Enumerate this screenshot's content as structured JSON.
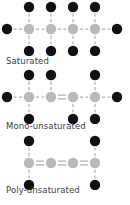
{
  "figure": {
    "background_color": "#ffffff",
    "carbon_color": "#b9b9b9",
    "hydrogen_color": "#111111",
    "bond_color": "#b0b0b0",
    "label_color": "#3d3d3d"
  },
  "legend_keys": {
    "carbon_atom": "carbon-atom-node",
    "hydrogen_atom": "hydrogen-atom-node",
    "single_bond": "single-bond-line",
    "double_bond": "double-bond-line"
  },
  "groups": [
    {
      "id": "saturated",
      "label": "Saturated",
      "carbon_count": 4,
      "carbons": [
        {
          "index": 1,
          "top_hydrogen": true,
          "bottom_hydrogen": true,
          "left_hydrogen": true,
          "right_hydrogen": false
        },
        {
          "index": 2,
          "top_hydrogen": true,
          "bottom_hydrogen": true,
          "left_hydrogen": false,
          "right_hydrogen": false
        },
        {
          "index": 3,
          "top_hydrogen": true,
          "bottom_hydrogen": true,
          "left_hydrogen": false,
          "right_hydrogen": false
        },
        {
          "index": 4,
          "top_hydrogen": true,
          "bottom_hydrogen": true,
          "left_hydrogen": false,
          "right_hydrogen": true
        }
      ],
      "backbone_bonds": [
        {
          "from": 1,
          "to": 2,
          "order": "single"
        },
        {
          "from": 2,
          "to": 3,
          "order": "single"
        },
        {
          "from": 3,
          "to": 4,
          "order": "single"
        }
      ],
      "double_bond_count": 0
    },
    {
      "id": "mono-unsaturated",
      "label": "Mono-unsaturated",
      "carbon_count": 4,
      "carbons": [
        {
          "index": 1,
          "top_hydrogen": true,
          "bottom_hydrogen": true,
          "left_hydrogen": true,
          "right_hydrogen": false
        },
        {
          "index": 2,
          "top_hydrogen": true,
          "bottom_hydrogen": false,
          "left_hydrogen": false,
          "right_hydrogen": false
        },
        {
          "index": 3,
          "top_hydrogen": false,
          "bottom_hydrogen": true,
          "left_hydrogen": false,
          "right_hydrogen": false
        },
        {
          "index": 4,
          "top_hydrogen": true,
          "bottom_hydrogen": true,
          "left_hydrogen": false,
          "right_hydrogen": true
        }
      ],
      "backbone_bonds": [
        {
          "from": 1,
          "to": 2,
          "order": "single"
        },
        {
          "from": 2,
          "to": 3,
          "order": "double"
        },
        {
          "from": 3,
          "to": 4,
          "order": "single"
        }
      ],
      "double_bond_count": 1
    },
    {
      "id": "poly-unsaturated",
      "label": "Poly-unsaturated",
      "carbon_count": 4,
      "carbons": [
        {
          "index": 1,
          "top_hydrogen": true,
          "bottom_hydrogen": true,
          "left_hydrogen": false,
          "right_hydrogen": false
        },
        {
          "index": 2,
          "top_hydrogen": false,
          "bottom_hydrogen": false,
          "left_hydrogen": false,
          "right_hydrogen": false
        },
        {
          "index": 3,
          "top_hydrogen": false,
          "bottom_hydrogen": false,
          "left_hydrogen": false,
          "right_hydrogen": false
        },
        {
          "index": 4,
          "top_hydrogen": true,
          "bottom_hydrogen": true,
          "left_hydrogen": false,
          "right_hydrogen": false
        }
      ],
      "backbone_bonds": [
        {
          "from": 1,
          "to": 2,
          "order": "double"
        },
        {
          "from": 2,
          "to": 3,
          "order": "double"
        },
        {
          "from": 3,
          "to": 4,
          "order": "double"
        }
      ],
      "double_bond_count": 3
    }
  ],
  "geometry": {
    "carbon_radius": 5.2,
    "hydrogen_radius": 5.2,
    "backbone_spacing": 22,
    "vertical_spacing": 22,
    "first_carbon_x": 29,
    "backbone_y": 29,
    "svg_width": 130,
    "svg_height": 56
  }
}
